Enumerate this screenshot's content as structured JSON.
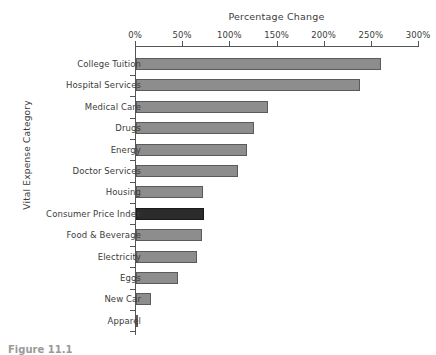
{
  "chart_data": {
    "type": "bar",
    "orientation": "horizontal",
    "title": "Percentage Change",
    "xlabel": "Percentage Change",
    "ylabel": "Vital Expense Category",
    "xlim": [
      0,
      300
    ],
    "xtick_labels": [
      "0%",
      "50%",
      "100%",
      "150%",
      "200%",
      "250%",
      "300%"
    ],
    "xtick_values": [
      0,
      50,
      100,
      150,
      200,
      250,
      300
    ],
    "grid": false,
    "legend": false,
    "categories": [
      "College Tuition",
      "Hospital Services",
      "Medical Care",
      "Drugs",
      "Energy",
      "Doctor Services",
      "Housing",
      "Consumer Price Index",
      "Food & Beverage",
      "Electricity",
      "Eggs",
      "New Car",
      "Apparel"
    ],
    "values": [
      260,
      237,
      140,
      125,
      118,
      108,
      71,
      72,
      70,
      65,
      45,
      16,
      1
    ],
    "highlight_category": "Consumer Price Index",
    "colors": {
      "bar": "#8d8d8d",
      "bar_edge": "#5a5a5a",
      "highlight_bar": "#2b2b2b",
      "highlight_edge": "#1a1a1a",
      "axis": "#555555",
      "text": "#3c3c3c",
      "background": "#ffffff"
    }
  },
  "caption": {
    "text": "Figure 11.1"
  }
}
